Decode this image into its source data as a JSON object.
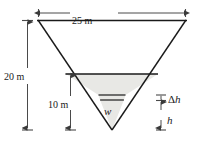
{
  "figure": {
    "name": "inverted-triangular-tank-cross-section",
    "colors": {
      "line": "#1a1a1a",
      "fill_water": "#e8e8e5",
      "background": "#ffffff",
      "dimension_line": "#4a4a4a"
    }
  },
  "labels": {
    "top_width": "25 m",
    "total_depth": "20 m",
    "water_depth": "10 m",
    "slab_thickness_delta": "Δ",
    "slab_thickness_var": "h",
    "slab_depth": "h",
    "slab_width": "w"
  },
  "geometry": {
    "top_left_x": 38,
    "top_right_x": 186,
    "top_y": 20,
    "apex_x": 112,
    "apex_y": 130,
    "water_surface_y": 74,
    "slab_top_y": 95,
    "slab_bottom_y": 100,
    "water_top_width_px": 148,
    "slab_width_px": 26
  },
  "dimensions": [
    {
      "name": "top-width-dimension",
      "value": "25 m",
      "orientation": "horizontal",
      "from_px": 38,
      "to_px": 186,
      "at_px": 20
    },
    {
      "name": "total-depth-dimension",
      "value": "20 m",
      "orientation": "vertical",
      "from_px": 20,
      "to_px": 130,
      "at_px": 27
    },
    {
      "name": "water-depth-dimension",
      "value": "10 m",
      "orientation": "vertical",
      "from_px": 74,
      "to_px": 130,
      "at_px": 70
    },
    {
      "name": "slab-thickness-dimension",
      "value": "Δh",
      "orientation": "vertical",
      "from_px": 95,
      "to_px": 100,
      "at_px": 161
    },
    {
      "name": "slab-depth-dimension",
      "value": "h",
      "orientation": "vertical",
      "from_px": 100,
      "to_px": 130,
      "at_px": 161
    }
  ]
}
